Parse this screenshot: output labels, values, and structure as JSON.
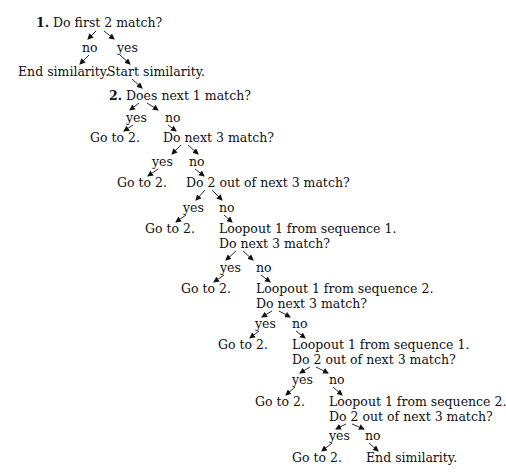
{
  "diagram": {
    "type": "decision-tree",
    "nodes": [
      {
        "id": "q1",
        "step": "1.",
        "text": "Do first 2 match?",
        "x": 36,
        "y": 15
      },
      {
        "id": "q1-no",
        "text": "no",
        "x": 82,
        "y": 40
      },
      {
        "id": "q1-yes",
        "text": "yes",
        "x": 117,
        "y": 40
      },
      {
        "id": "end1",
        "text": "End similarity.",
        "x": 18,
        "y": 64
      },
      {
        "id": "start",
        "text": "Start similarity.",
        "x": 107,
        "y": 64
      },
      {
        "id": "q2",
        "step": "2.",
        "text": "Does next 1 match?",
        "x": 109,
        "y": 88
      },
      {
        "id": "q2-yes",
        "text": "yes",
        "x": 126,
        "y": 110
      },
      {
        "id": "q2-no",
        "text": "no",
        "x": 165,
        "y": 110
      },
      {
        "id": "g1",
        "text": "Go to 2.",
        "x": 90,
        "y": 130
      },
      {
        "id": "q3",
        "text": "Do next 3 match?",
        "x": 163,
        "y": 130
      },
      {
        "id": "q3-yes",
        "text": "yes",
        "x": 152,
        "y": 154
      },
      {
        "id": "q3-no",
        "text": "no",
        "x": 189,
        "y": 154
      },
      {
        "id": "g2",
        "text": "Go to 2.",
        "x": 117,
        "y": 175
      },
      {
        "id": "q4",
        "text": "Do 2 out of next 3 match?",
        "x": 186,
        "y": 175
      },
      {
        "id": "q4-yes",
        "text": "yes",
        "x": 183,
        "y": 200
      },
      {
        "id": "q4-no",
        "text": "no",
        "x": 219,
        "y": 200
      },
      {
        "id": "g3",
        "text": "Go to 2.",
        "x": 145,
        "y": 221
      },
      {
        "id": "q5a",
        "text": "Loopout 1 from sequence 1.",
        "x": 219,
        "y": 221
      },
      {
        "id": "q5b",
        "text": "Do next 3 match?",
        "x": 219,
        "y": 236
      },
      {
        "id": "q5-yes",
        "text": "yes",
        "x": 220,
        "y": 260
      },
      {
        "id": "q5-no",
        "text": "no",
        "x": 256,
        "y": 260
      },
      {
        "id": "g4",
        "text": "Go to 2.",
        "x": 181,
        "y": 281
      },
      {
        "id": "q6a",
        "text": "Loopout 1 from sequence 2.",
        "x": 256,
        "y": 281
      },
      {
        "id": "q6b",
        "text": "Do next 3 match?",
        "x": 256,
        "y": 296
      },
      {
        "id": "q6-yes",
        "text": "yes",
        "x": 255,
        "y": 316
      },
      {
        "id": "q6-no",
        "text": "no",
        "x": 292,
        "y": 316
      },
      {
        "id": "g5",
        "text": "Go to 2.",
        "x": 218,
        "y": 337
      },
      {
        "id": "q7a",
        "text": "Loopout 1 from sequence 1.",
        "x": 292,
        "y": 337
      },
      {
        "id": "q7b",
        "text": "Do 2 out of next 3 match?",
        "x": 292,
        "y": 352
      },
      {
        "id": "q7-yes",
        "text": "yes",
        "x": 292,
        "y": 372
      },
      {
        "id": "q7-no",
        "text": "no",
        "x": 329,
        "y": 372
      },
      {
        "id": "g6",
        "text": "Go to 2.",
        "x": 255,
        "y": 394
      },
      {
        "id": "q8a",
        "text": "Loopout 1 from sequence 2.",
        "x": 329,
        "y": 394
      },
      {
        "id": "q8b",
        "text": "Do 2 out of next 3 match?",
        "x": 329,
        "y": 409
      },
      {
        "id": "q8-yes",
        "text": "yes",
        "x": 329,
        "y": 428
      },
      {
        "id": "q8-no",
        "text": "no",
        "x": 365,
        "y": 428
      },
      {
        "id": "g7",
        "text": "Go to 2.",
        "x": 292,
        "y": 450
      },
      {
        "id": "end2",
        "text": "End similarity.",
        "x": 366,
        "y": 450
      }
    ],
    "arrows": [
      [
        96,
        31,
        88,
        39
      ],
      [
        104,
        31,
        114,
        39
      ],
      [
        89,
        55,
        80,
        64
      ],
      [
        120,
        55,
        130,
        64
      ],
      [
        132,
        79,
        142,
        88
      ],
      [
        139,
        103,
        130,
        110
      ],
      [
        147,
        103,
        158,
        110
      ],
      [
        133,
        125,
        124,
        131
      ],
      [
        168,
        125,
        176,
        131
      ],
      [
        181,
        145,
        172,
        154
      ],
      [
        188,
        145,
        198,
        154
      ],
      [
        158,
        169,
        148,
        176
      ],
      [
        195,
        169,
        204,
        176
      ],
      [
        205,
        190,
        196,
        200
      ],
      [
        212,
        190,
        222,
        200
      ],
      [
        186,
        215,
        176,
        222
      ],
      [
        224,
        215,
        232,
        222
      ],
      [
        236,
        251,
        226,
        260
      ],
      [
        243,
        251,
        253,
        260
      ],
      [
        224,
        275,
        214,
        282
      ],
      [
        261,
        275,
        270,
        282
      ],
      [
        272,
        311,
        262,
        317
      ],
      [
        279,
        311,
        290,
        317
      ],
      [
        259,
        331,
        250,
        338
      ],
      [
        296,
        331,
        305,
        338
      ],
      [
        310,
        367,
        300,
        373
      ],
      [
        316,
        367,
        328,
        373
      ],
      [
        295,
        387,
        286,
        395
      ],
      [
        333,
        387,
        342,
        395
      ],
      [
        346,
        424,
        336,
        429
      ],
      [
        352,
        424,
        364,
        429
      ],
      [
        332,
        443,
        322,
        451
      ],
      [
        369,
        443,
        378,
        451
      ]
    ]
  }
}
